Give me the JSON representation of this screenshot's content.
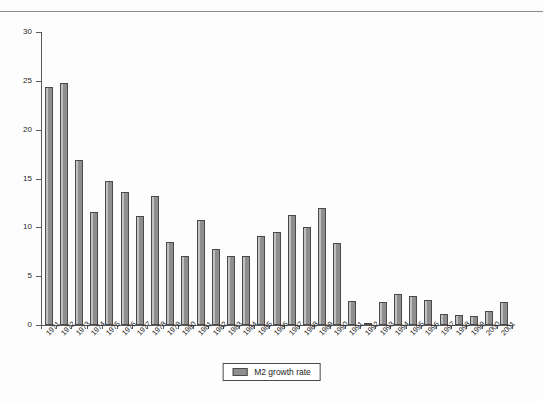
{
  "page": {
    "rule_visible": true,
    "background": "#fdfdfd"
  },
  "chart_data": {
    "type": "bar",
    "title": "",
    "subtitle": "",
    "xlabel": "",
    "ylabel": "",
    "ylim": [
      0,
      30
    ],
    "yticks": [
      "0",
      "5",
      "10",
      "15",
      "20",
      "25",
      "30"
    ],
    "ytick_values": [
      0,
      5,
      10,
      15,
      20,
      25,
      30
    ],
    "grid": false,
    "legend_position": "bottom-center",
    "legend": [
      "M2 growth rate"
    ],
    "series_color": "#8e8e8e",
    "categories": [
      "1971",
      "1972",
      "1973",
      "1974",
      "1975",
      "1976",
      "1977",
      "1978",
      "1979",
      "1980",
      "1981",
      "1982",
      "1983",
      "1984",
      "1985",
      "1986",
      "1987",
      "1988",
      "1989",
      "1990",
      "1991",
      "1992",
      "1993",
      "1994",
      "1995",
      "1996",
      "1997",
      "1998",
      "1999",
      "2000",
      "2001"
    ],
    "series": [
      {
        "name": "M2 growth rate",
        "values": [
          24.4,
          24.8,
          16.9,
          11.6,
          14.7,
          13.6,
          11.2,
          13.2,
          8.5,
          7.1,
          10.8,
          7.8,
          7.1,
          7.1,
          9.1,
          9.5,
          11.3,
          10.0,
          12.0,
          8.4,
          2.5,
          0.2,
          2.4,
          3.2,
          3.0,
          2.6,
          1.1,
          1.0,
          0.9,
          1.4,
          2.4
        ]
      }
    ]
  },
  "legend": {
    "label": "M2 growth rate",
    "swatch_name": "m2-growth-rate-swatch"
  }
}
